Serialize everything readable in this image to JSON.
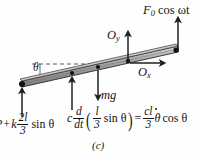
{
  "figure": {
    "caption": "(c)",
    "type": "free-body-diagram"
  },
  "labels": {
    "applied_force": {
      "symbol": "F",
      "subscript": "0",
      "rest": "cos ωt",
      "full": "F₀ cos ωt"
    },
    "reaction_y": {
      "symbol": "O",
      "subscript": "y",
      "full": "Oᵧ"
    },
    "reaction_x": {
      "symbol": "O",
      "subscript": "x",
      "full": "Oₓ"
    },
    "angle": {
      "symbol": "θ",
      "full": "θ"
    },
    "weight": {
      "symbol": "mg",
      "full": "mg"
    }
  },
  "equations": {
    "spring_force": {
      "lead": "P",
      "plus": "+",
      "coefficient": "k",
      "fraction_num": "2l",
      "fraction_den": "3",
      "trig": "sin θ",
      "full": "P + k (2l/3) sin θ"
    },
    "damper_force": {
      "coefficient": "c",
      "derivative_num": "d",
      "derivative_den": "dt",
      "inner_num": "l",
      "inner_den": "3",
      "inner_trig": "sin θ",
      "equals": "=",
      "result_num": "cl",
      "result_den": "3",
      "result_var": "θ",
      "result_trig": "cos θ",
      "full": "c d/dt ( l/3 sin θ ) = cl/3 θ̇ cos θ"
    }
  },
  "colors": {
    "bar_fill": "#9a9a9a",
    "bar_edge": "#3a3a3a",
    "bar_top_highlight": "#c9c9c9",
    "arrow": "#1f1f1f",
    "dashed_line": "#5a5a5a",
    "pivot_dot": "#111111",
    "background": "#fefefe"
  },
  "geometry": {
    "bar_left_end": [
      22,
      85
    ],
    "bar_right_end": [
      178,
      50
    ],
    "pivot_dot": [
      22,
      85
    ],
    "dashed_line_y": 64,
    "arrows": [
      {
        "name": "spring-force-arrow",
        "x": 22,
        "from_y": 116,
        "to_y": 87,
        "direction": "up"
      },
      {
        "name": "damper-force-arrow",
        "x": 72,
        "from_y": 110,
        "to_y": 76,
        "direction": "up"
      },
      {
        "name": "weight-arrow",
        "x": 98,
        "from_y": 71,
        "to_y": 98,
        "direction": "down"
      },
      {
        "name": "reaction-y-arrow",
        "x": 128,
        "from_y": 64,
        "to_y": 34,
        "direction": "up"
      },
      {
        "name": "reaction-x-arrow",
        "x_from": 128,
        "x_to": 162,
        "y": 62,
        "direction": "right"
      },
      {
        "name": "applied-force-arrow",
        "x": 178,
        "from_y": 52,
        "to_y": 20,
        "direction": "up"
      }
    ]
  }
}
